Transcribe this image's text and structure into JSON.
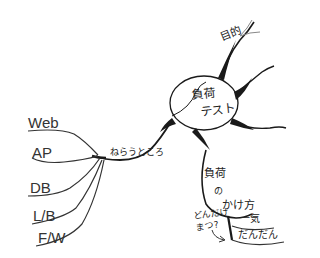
{
  "mindmap": {
    "central": {
      "line1": "負荷",
      "line2": "テスト"
    },
    "branches": {
      "purpose": {
        "label": "目的"
      },
      "target": {
        "label": "ねらうところ",
        "children": [
          "Web",
          "AP",
          "DB",
          "L/B",
          "F/W"
        ]
      },
      "load_method": {
        "line1": "負荷",
        "line2": "の",
        "line3": "かけ方",
        "children": [
          "一気",
          "だんだん"
        ],
        "note_line1": "どんだけ",
        "note_line2": "まつ?"
      }
    },
    "colors": {
      "ink": "#1a1a1a",
      "faint": "#888888"
    }
  }
}
